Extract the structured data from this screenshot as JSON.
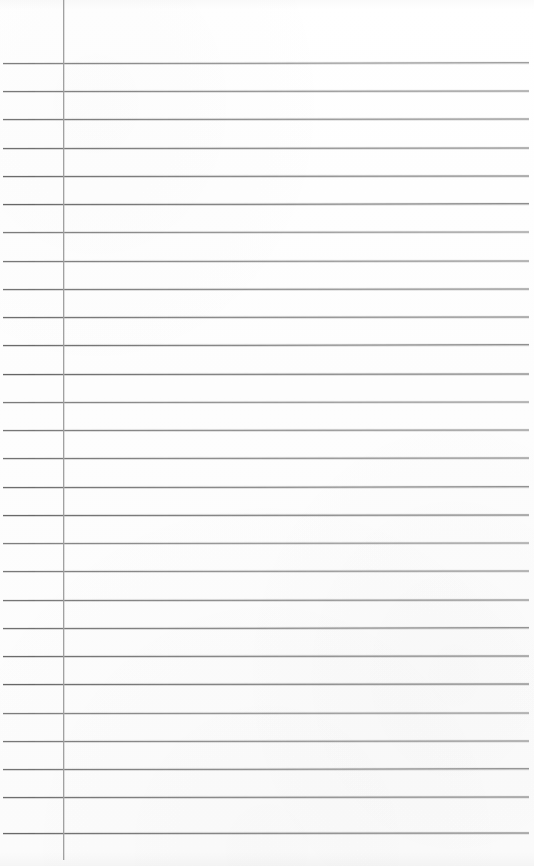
{
  "document": {
    "type": "scanned-ruled-notebook-page",
    "title": "Blank Ruled Notebook Page",
    "content_text": "",
    "page_width_px": 534,
    "page_height_px": 866,
    "background_color": "#fdfdfd",
    "is_blank": true
  },
  "ruling": {
    "horizontal_rule_color": "#5f5f5f",
    "horizontal_rule_thickness_px": 1,
    "first_rule_y_px": 63,
    "rule_spacing_px": 28.2,
    "rule_count": 28,
    "rule_left_x_px": 3,
    "rule_right_x_px": 529,
    "rule_skew_deg": -0.06,
    "rule_y_positions": [
      63,
      91,
      119,
      148,
      176,
      204,
      232,
      261,
      289,
      317,
      345,
      374,
      402,
      430,
      458,
      487,
      515,
      543,
      571,
      600,
      628,
      656,
      684,
      713,
      741,
      769,
      797,
      833
    ]
  },
  "margin": {
    "vertical_margin_line_color": "#9d9d9d",
    "vertical_margin_line_x_px": 63,
    "vertical_margin_line_top_y_px": 0,
    "vertical_margin_line_bottom_y_px": 860,
    "vertical_margin_line_thickness_px": 1
  },
  "regions": {
    "header_area_label": "",
    "margin_column_label": "",
    "writing_area_label": ""
  }
}
